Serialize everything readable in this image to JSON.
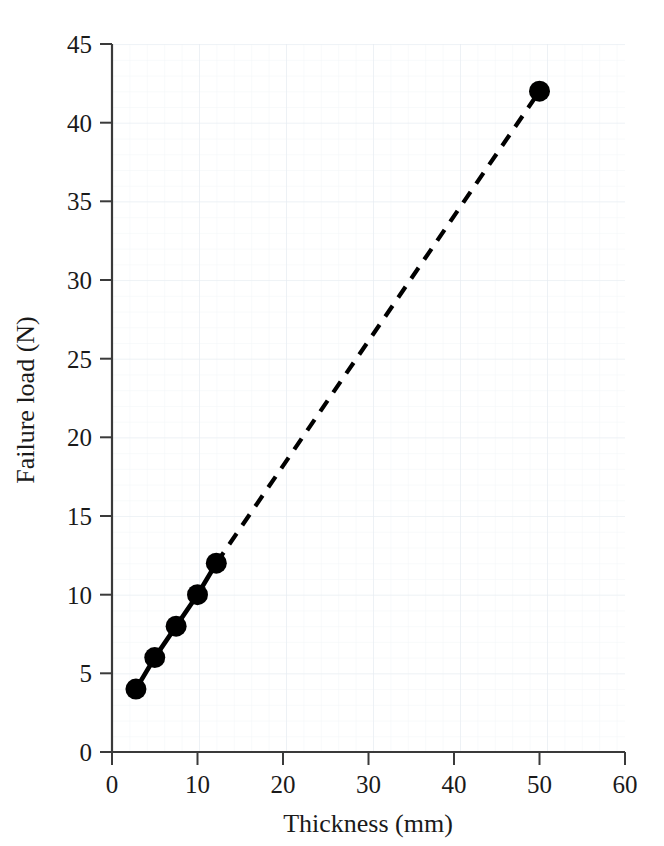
{
  "chart_data": {
    "type": "line",
    "title": "",
    "subtitle": "",
    "xlabel": "Thickness (mm)",
    "ylabel": "Failure load (N)",
    "xlim": [
      0,
      60
    ],
    "ylim": [
      0,
      45
    ],
    "xticks": [
      0,
      10,
      20,
      30,
      40,
      50,
      60
    ],
    "yticks": [
      0,
      5,
      10,
      15,
      20,
      25,
      30,
      35,
      40,
      45
    ],
    "xtick_labels": [
      "0",
      "10",
      "20",
      "30",
      "40",
      "50",
      "60"
    ],
    "ytick_labels": [
      "0",
      "5",
      "10",
      "15",
      "20",
      "25",
      "30",
      "35",
      "40",
      "45"
    ],
    "grid": true,
    "grid_minor": true,
    "grid_color": "#e8edf2",
    "grid_minor_color": "#f3f6f9",
    "legend": false,
    "legend_position": "none",
    "marker": "filled-circle",
    "marker_color": "#000000",
    "line_color": "#000000",
    "series": [
      {
        "name": "measured",
        "style": "solid",
        "x": [
          2.8,
          5.0,
          7.5,
          10.0,
          12.2
        ],
        "y": [
          4,
          6,
          8,
          10,
          12
        ]
      },
      {
        "name": "extrapolated",
        "style": "dashed",
        "x": [
          12.2,
          50.0
        ],
        "y": [
          12,
          42
        ]
      }
    ],
    "points": [
      {
        "x": 2.8,
        "y": 4
      },
      {
        "x": 5.0,
        "y": 6
      },
      {
        "x": 7.5,
        "y": 8
      },
      {
        "x": 10.0,
        "y": 10
      },
      {
        "x": 12.2,
        "y": 12
      },
      {
        "x": 50.0,
        "y": 42
      }
    ],
    "annotations": []
  }
}
